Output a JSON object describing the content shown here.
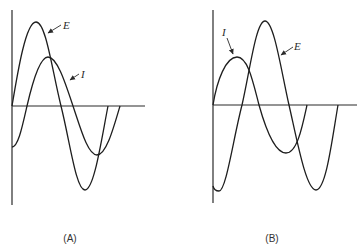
{
  "figure": {
    "panels": [
      {
        "id": "A",
        "caption": "(A)",
        "description": "Voltage E leads current I",
        "curves": [
          {
            "name": "E",
            "label": "E",
            "role": "voltage",
            "amplitude": "large",
            "phase": "leading"
          },
          {
            "name": "I",
            "label": "I",
            "role": "current",
            "amplitude": "small",
            "phase": "lagging"
          }
        ]
      },
      {
        "id": "B",
        "caption": "(B)",
        "description": "Current I leads voltage E",
        "curves": [
          {
            "name": "I",
            "label": "I",
            "role": "current",
            "amplitude": "small",
            "phase": "leading"
          },
          {
            "name": "E",
            "label": "E",
            "role": "voltage",
            "amplitude": "large",
            "phase": "lagging"
          }
        ]
      }
    ]
  },
  "labels": {
    "a_e": "E",
    "a_i": "I",
    "b_i": "I",
    "b_e": "E",
    "cap_a": "(A)",
    "cap_b": "(B)"
  },
  "colors": {
    "line": "#1e1e1e",
    "background": "#ffffff"
  }
}
